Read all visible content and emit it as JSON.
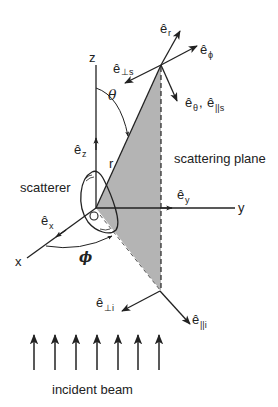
{
  "diagram": {
    "axes": {
      "x": "x",
      "y": "y",
      "z": "z"
    },
    "origin_label": "O",
    "unit_vectors": {
      "ex": {
        "base": "ê",
        "sub": "x"
      },
      "ey": {
        "base": "ê",
        "sub": "y"
      },
      "ez": {
        "base": "ê",
        "sub": "z"
      },
      "er": {
        "base": "ê",
        "sub": "r"
      },
      "ephi": {
        "base": "ê",
        "sub": "ϕ"
      },
      "etheta_par_s": {
        "base": "ê",
        "sub": "θ",
        "sep": ", ",
        "base2": "ê",
        "sub2": "||s"
      },
      "eperp_s": {
        "base": "ê",
        "sub": "⊥s"
      },
      "eperp_i": {
        "base": "ê",
        "sub": "⊥i"
      },
      "epar_i": {
        "base": "ê",
        "sub": "||i"
      }
    },
    "angles": {
      "theta": "θ",
      "phi": "ϕ"
    },
    "radius_label": "r",
    "labels": {
      "scatterer": "scatterer",
      "scattering_plane": "scattering plane",
      "incident_beam": "incident beam"
    },
    "incident_beam_arrow_count": 7,
    "colors": {
      "line": "#222222",
      "plane_fill": "#b4b4b4",
      "background": "#ffffff"
    }
  }
}
